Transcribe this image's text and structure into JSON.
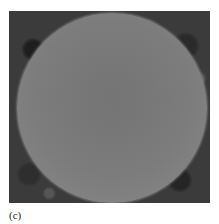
{
  "figure": {
    "caption": "(c)",
    "image": {
      "description": "Grayscale micrograph of a single spherical particle on a dark textured background",
      "colors": {
        "particle": "#7a7a7a",
        "background": "#3b3b3b"
      }
    }
  }
}
